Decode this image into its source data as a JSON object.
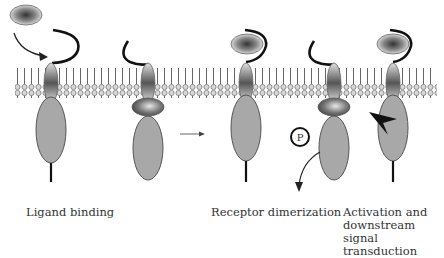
{
  "diagram": {
    "type": "receptor signaling schematic",
    "colors": {
      "membrane": "#888888",
      "receptor_body": "#a8a8a8",
      "outline": "#555555",
      "ligand_arm": "#111111",
      "background": "#ffffff"
    },
    "stages": [
      {
        "label": "Ligand binding"
      },
      {
        "label": "Receptor dimerization"
      },
      {
        "label": "Activation and downstream signal transduction",
        "lines": [
          "Activation and",
          "downstream signal",
          "transduction"
        ]
      }
    ],
    "phosphate_label": "P"
  }
}
